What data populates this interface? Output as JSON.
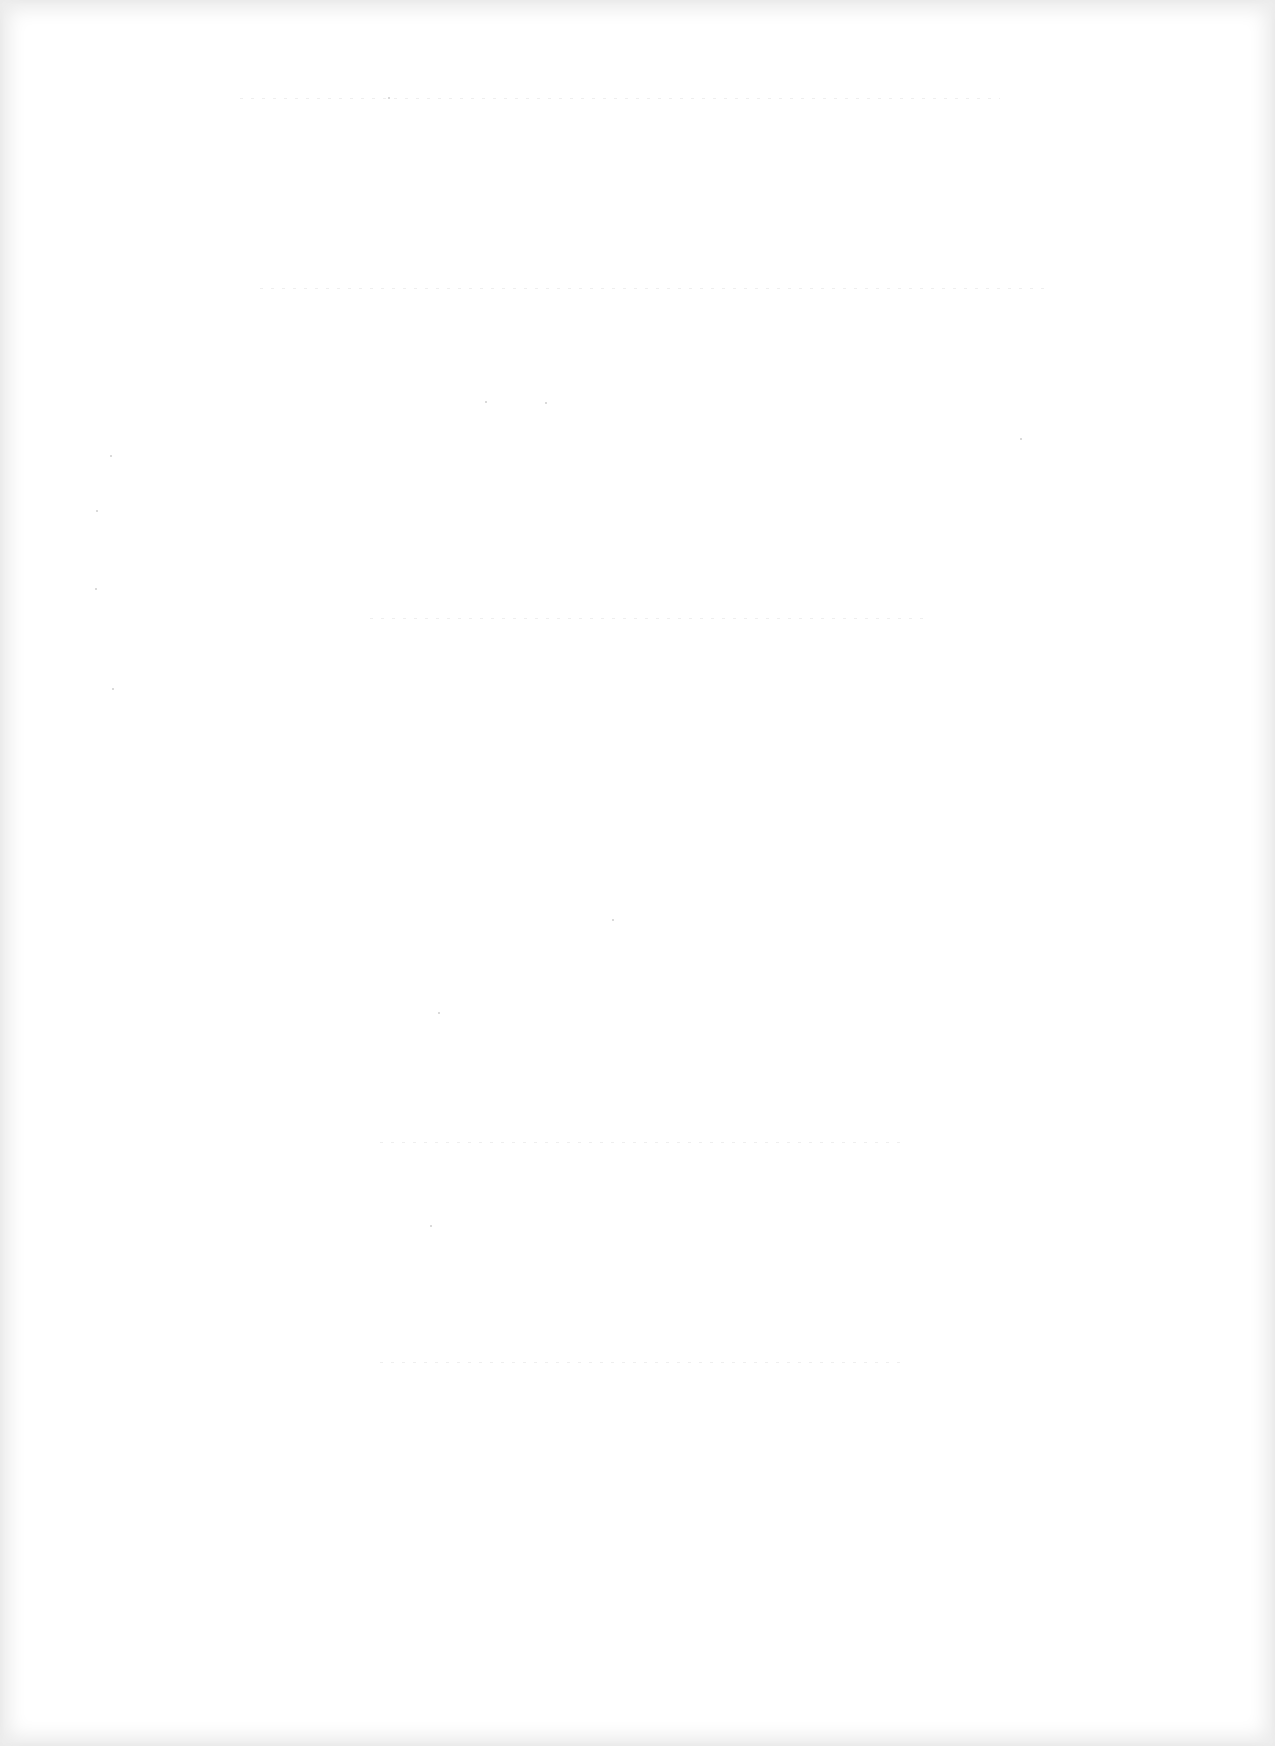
{
  "document": {
    "type": "scanned-page",
    "content": "",
    "is_blank": true
  }
}
